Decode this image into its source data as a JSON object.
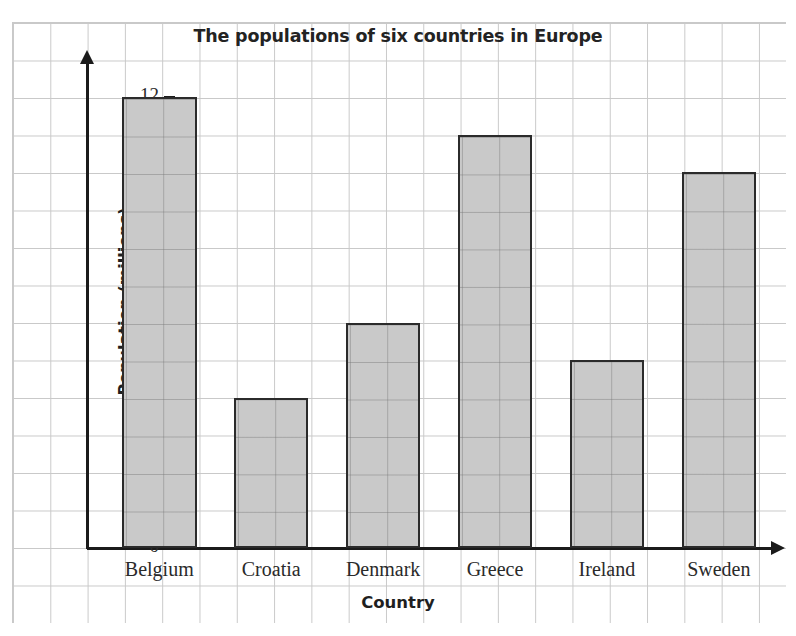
{
  "chart_data": {
    "type": "bar",
    "title": "The populations of six countries in Europe",
    "xlabel": "Country",
    "ylabel": "Population (millions)",
    "categories": [
      "Belgium",
      "Croatia",
      "Denmark",
      "Greece",
      "Ireland",
      "Sweden"
    ],
    "values": [
      12,
      4,
      6,
      11,
      5,
      10
    ],
    "ylim": [
      0,
      12
    ],
    "ytick_labels": [
      "0",
      "2",
      "4",
      "6",
      "8",
      "10",
      "12"
    ],
    "ytick_values": [
      0,
      2,
      4,
      6,
      8,
      10,
      12
    ],
    "minor_tick_values": [
      1,
      3,
      5,
      7,
      9,
      11
    ],
    "grid": true,
    "legend": "none",
    "bar_fill_color": "#c9c9c9",
    "bar_edge_color": "#2b2b2b",
    "grid_color": "#c9c9c9",
    "axis_color": "#1b1b1b",
    "text_color": "#2a2a2a"
  }
}
